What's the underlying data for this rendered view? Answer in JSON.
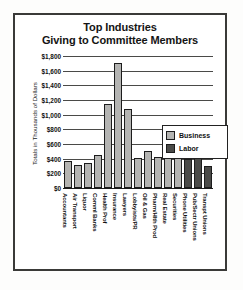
{
  "chart_data": {
    "type": "bar",
    "title": "Top Industries",
    "subtitle": "Giving to Committee Members",
    "xlabel": "",
    "ylabel": "Totals in Thousands of Dollars",
    "ylim": [
      0,
      1800
    ],
    "ytick_labels": [
      "$1,800",
      "$1,600",
      "$1,400",
      "$1,200",
      "$1,000",
      "$800",
      "$600",
      "$400",
      "$200",
      "$0"
    ],
    "ytick_values": [
      1800,
      1600,
      1400,
      1200,
      1000,
      800,
      600,
      400,
      200,
      0
    ],
    "grid": true,
    "legend_position": "upper right",
    "categories": [
      "Accountants",
      "Air Transport",
      "Liquor",
      "Comml Banks",
      "Health Prof",
      "Insurance",
      "Lawyers",
      "Lobbyists/PR",
      "Oil & Gas",
      "Pharm/Hlth Prod",
      "Real Estate",
      "Securities",
      "Phone Utilities",
      "Pub/Sectr Unions",
      "Transpt Unions"
    ],
    "series": [
      {
        "name": "Business",
        "color": "#b4b4b2",
        "values": [
          370,
          320,
          340,
          450,
          1150,
          1710,
          1080,
          410,
          510,
          425,
          580,
          810,
          0,
          0,
          0
        ]
      },
      {
        "name": "Labor",
        "color": "#4a4a48",
        "values": [
          0,
          0,
          0,
          0,
          0,
          0,
          0,
          0,
          0,
          0,
          0,
          0,
          400,
          650,
          300
        ]
      }
    ],
    "bars": [
      {
        "category": "Accountants",
        "value": 370,
        "group": "Business"
      },
      {
        "category": "Air Transport",
        "value": 320,
        "group": "Business"
      },
      {
        "category": "Liquor",
        "value": 340,
        "group": "Business"
      },
      {
        "category": "Comml Banks",
        "value": 450,
        "group": "Business"
      },
      {
        "category": "Health Prof",
        "value": 1150,
        "group": "Business"
      },
      {
        "category": "Insurance",
        "value": 1710,
        "group": "Business"
      },
      {
        "category": "Lawyers",
        "value": 1080,
        "group": "Business"
      },
      {
        "category": "Lobbyists/PR",
        "value": 410,
        "group": "Business"
      },
      {
        "category": "Oil & Gas",
        "value": 510,
        "group": "Business"
      },
      {
        "category": "Pharm/Hlth Prod",
        "value": 425,
        "group": "Business"
      },
      {
        "category": "Real Estate",
        "value": 580,
        "group": "Business"
      },
      {
        "category": "Securities",
        "value": 810,
        "group": "Business"
      },
      {
        "category": "Phone Utilities",
        "value": 400,
        "group": "Labor"
      },
      {
        "category": "Pub/Sectr Unions",
        "value": 650,
        "group": "Labor"
      },
      {
        "category": "Transpt Unions",
        "value": 300,
        "group": "Labor"
      }
    ],
    "legend": [
      {
        "label": "Business",
        "color": "#b4b4b2"
      },
      {
        "label": "Labor",
        "color": "#4a4a48"
      }
    ]
  }
}
